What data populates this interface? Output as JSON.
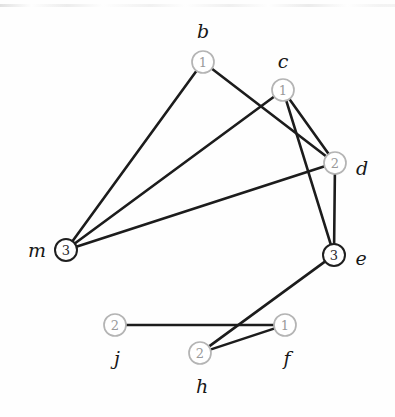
{
  "figure": {
    "kind": "undirected-graph-diagram",
    "background_color": "#fefefe",
    "edge_color": "#1c1c1c",
    "node_fill_color": "#ffffff",
    "node_stroke_light": "#b4b4b4",
    "node_stroke_dark": "#1f1f1f",
    "node_value_color_light": "#9a9a9a",
    "node_value_color_dark": "#2a2a2a",
    "label_color": "#171717",
    "width": 395,
    "height": 417
  },
  "nodes": [
    {
      "id": "b",
      "label": "b",
      "value": "1",
      "x": 203,
      "y": 62,
      "r": 11,
      "style": "light",
      "label_x": 203,
      "label_y": 31
    },
    {
      "id": "c",
      "label": "c",
      "value": "1",
      "x": 283,
      "y": 90,
      "r": 11,
      "style": "light",
      "label_x": 283,
      "label_y": 61
    },
    {
      "id": "d",
      "label": "d",
      "value": "2",
      "x": 335,
      "y": 163,
      "r": 11,
      "style": "light",
      "label_x": 362,
      "label_y": 168
    },
    {
      "id": "e",
      "label": "e",
      "value": "3",
      "x": 334,
      "y": 255,
      "r": 11,
      "style": "dark",
      "label_x": 361,
      "label_y": 258
    },
    {
      "id": "m",
      "label": "m",
      "value": "3",
      "x": 66,
      "y": 250,
      "r": 11,
      "style": "dark",
      "label_x": 37,
      "label_y": 250
    },
    {
      "id": "j",
      "label": "j",
      "value": "2",
      "x": 115,
      "y": 325,
      "r": 11,
      "style": "light",
      "label_x": 117,
      "label_y": 358
    },
    {
      "id": "h",
      "label": "h",
      "value": "2",
      "x": 200,
      "y": 353,
      "r": 11,
      "style": "light",
      "label_x": 202,
      "label_y": 386
    },
    {
      "id": "f",
      "label": "f",
      "value": "1",
      "x": 285,
      "y": 325,
      "r": 11,
      "style": "light",
      "label_x": 287,
      "label_y": 358
    }
  ],
  "edges": [
    {
      "id": "b-m",
      "source": "b",
      "target": "m"
    },
    {
      "id": "b-d",
      "source": "b",
      "target": "d"
    },
    {
      "id": "c-m",
      "source": "c",
      "target": "m"
    },
    {
      "id": "c-d",
      "source": "c",
      "target": "d"
    },
    {
      "id": "c-e",
      "source": "c",
      "target": "e"
    },
    {
      "id": "m-d",
      "source": "m",
      "target": "d"
    },
    {
      "id": "d-e",
      "source": "d",
      "target": "e"
    },
    {
      "id": "e-h",
      "source": "e",
      "target": "h"
    },
    {
      "id": "j-f",
      "source": "j",
      "target": "f"
    },
    {
      "id": "h-f",
      "source": "h",
      "target": "f"
    }
  ]
}
